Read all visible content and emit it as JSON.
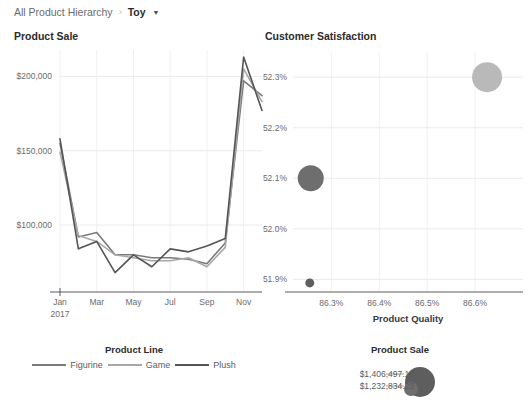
{
  "breadcrumb": {
    "root": "All Product Hierarchy",
    "separator": "›",
    "current": "Toy",
    "caret": "▼"
  },
  "panels": {
    "left_title": "Product Sale",
    "right_title": "Customer Satisfaction"
  },
  "legends": {
    "product_line": {
      "title": "Product Line",
      "items": [
        {
          "label": "Figurine",
          "color": "#7a7a7a"
        },
        {
          "label": "Game",
          "color": "#a8a8a8"
        },
        {
          "label": "Plush",
          "color": "#555555"
        }
      ]
    },
    "product_sale": {
      "title": "Product Sale",
      "sizes": [
        {
          "label": "$1,406,497.10",
          "color": "#5e5e5e"
        },
        {
          "label": "$1,232,834.23",
          "color": "#6e6e6e"
        }
      ]
    }
  },
  "chart_data": [
    {
      "type": "line",
      "title": "Product Sale",
      "xlabel": "",
      "ylabel": "",
      "grid": true,
      "legend_position": "bottom",
      "ylim": [
        55000,
        215000
      ],
      "ytick_labels": [
        "$200,000",
        "$150,000",
        "$100,000"
      ],
      "ytick_values": [
        200000,
        150000,
        100000
      ],
      "xtick_labels": [
        "Jan\n2017",
        "Mar",
        "May",
        "Jul",
        "Sep",
        "Nov"
      ],
      "x_first_line": "Jan",
      "x_first_line2": "2017",
      "categories": [
        "Jan",
        "Feb",
        "Mar",
        "Apr",
        "May",
        "Jun",
        "Jul",
        "Aug",
        "Sep",
        "Oct",
        "Nov",
        "Dec"
      ],
      "series": [
        {
          "name": "Figurine",
          "color": "#7a7a7a",
          "values": [
            155000,
            92000,
            95000,
            80000,
            80000,
            78000,
            78000,
            77000,
            74000,
            88000,
            197000,
            187000
          ]
        },
        {
          "name": "Game",
          "color": "#a8a8a8",
          "values": [
            149000,
            93000,
            89000,
            80000,
            78000,
            76000,
            76000,
            78000,
            72000,
            85000,
            205000,
            183000
          ]
        },
        {
          "name": "Plush",
          "color": "#555555",
          "values": [
            158000,
            84000,
            89000,
            68000,
            80000,
            72000,
            84000,
            82000,
            86000,
            91000,
            213000,
            177000
          ]
        }
      ]
    },
    {
      "type": "scatter",
      "title": "Customer Satisfaction",
      "xlabel": "Product Quality",
      "ylabel": "Customer Satisfaction",
      "grid": true,
      "xlim": [
        86.22,
        86.7
      ],
      "ylim": [
        51.875,
        52.33
      ],
      "xtick_labels": [
        "86.3%",
        "86.4%",
        "86.5%",
        "86.6%"
      ],
      "xtick_values": [
        86.3,
        86.4,
        86.5,
        86.6
      ],
      "ytick_labels": [
        "52.3%",
        "52.2%",
        "52.1%",
        "52.0%",
        "51.9%"
      ],
      "ytick_values": [
        52.3,
        52.2,
        52.1,
        52.0,
        51.9
      ],
      "size_field": "Product Sale",
      "points": [
        {
          "label": "Plush",
          "x": 86.625,
          "y": 52.3,
          "size": 1406497.1,
          "r": 15,
          "color": "#b9b9b9"
        },
        {
          "label": "Figurine",
          "x": 86.257,
          "y": 52.1,
          "size": 1232834.23,
          "r": 13,
          "color": "#6e6e6e"
        },
        {
          "label": "Game",
          "x": 86.255,
          "y": 51.893,
          "size": 320000.0,
          "r": 4.5,
          "color": "#5e5e5e"
        }
      ]
    }
  ],
  "axis_titles": {
    "product_quality": "Product Quality"
  }
}
